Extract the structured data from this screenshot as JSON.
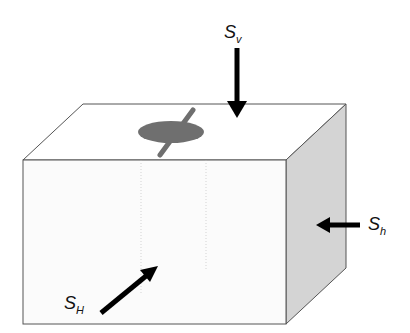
{
  "diagram": {
    "type": "stress-block",
    "colors": {
      "line": "#555555",
      "front": "#fbfbfb",
      "top": "#ffffff",
      "side": "#d4d4d4",
      "fracture": "#6f6f6f",
      "arrow": "#000000"
    },
    "labels": {
      "sv": {
        "main": "S",
        "sub": "v"
      },
      "sh": {
        "main": "S",
        "sub": "h"
      },
      "sH": {
        "main": "S",
        "sub": "H"
      }
    }
  }
}
